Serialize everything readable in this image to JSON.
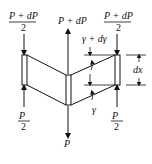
{
  "diagram": {
    "type": "force-diagram",
    "labels": {
      "top_left_num": "P + dP",
      "top_left_den": "2",
      "top_center": "P + dP",
      "top_right_num": "P + dP",
      "top_right_den": "2",
      "angle_top": "γ + dγ",
      "angle_bottom": "γ",
      "dimension": "dx",
      "bottom_left_num": "P",
      "bottom_left_den": "2",
      "bottom_center": "P",
      "bottom_right_num": "P",
      "bottom_right_den": "2"
    },
    "colors": {
      "stroke": "#111111",
      "background": "#ffffff"
    }
  }
}
